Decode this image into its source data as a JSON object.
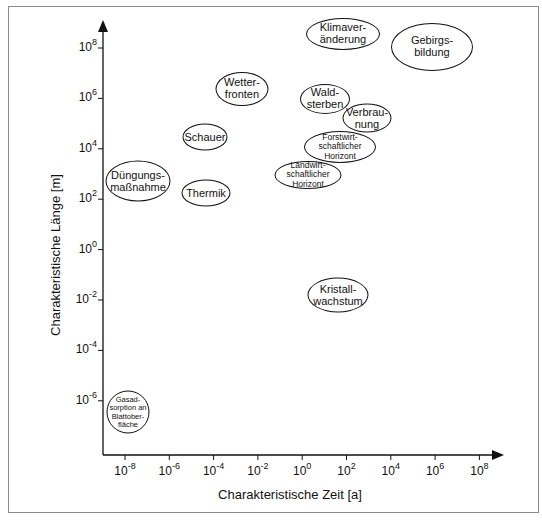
{
  "chart_data": {
    "type": "scatter",
    "title": "",
    "xlabel": "Charakteristische Zeit [a]",
    "ylabel": "Charakteristische Länge [m]",
    "xscale": "log",
    "yscale": "log",
    "x_tick_labels": [
      {
        "base": "10",
        "exp": "-8"
      },
      {
        "base": "10",
        "exp": "-6"
      },
      {
        "base": "10",
        "exp": "-4"
      },
      {
        "base": "10",
        "exp": "-2"
      },
      {
        "base": "10",
        "exp": "0"
      },
      {
        "base": "10",
        "exp": "2"
      },
      {
        "base": "10",
        "exp": "4"
      },
      {
        "base": "10",
        "exp": "6"
      },
      {
        "base": "10",
        "exp": "8"
      }
    ],
    "y_tick_labels": [
      {
        "base": "10",
        "exp": "8"
      },
      {
        "base": "10",
        "exp": "6"
      },
      {
        "base": "10",
        "exp": "4"
      },
      {
        "base": "10",
        "exp": "2"
      },
      {
        "base": "10",
        "exp": "0"
      },
      {
        "base": "10",
        "exp": "-2"
      },
      {
        "base": "10",
        "exp": "-4"
      },
      {
        "base": "10",
        "exp": "-6"
      }
    ],
    "xlim_log10": [
      -9,
      10
    ],
    "ylim_log10": [
      -8,
      9
    ],
    "grid": false,
    "legend": null,
    "points": [
      {
        "label": "Klimaver-\nänderung",
        "log10_time": 1.8,
        "log10_length": 8.6,
        "cx": 343,
        "cy": 34,
        "w": 74,
        "h": 32,
        "font": 11
      },
      {
        "label": "Gebirgs-\nbildung",
        "log10_time": 5.9,
        "log10_length": 8.1,
        "cx": 432,
        "cy": 47,
        "w": 82,
        "h": 48,
        "font": 11
      },
      {
        "label": "Wetter-\nfronten",
        "log10_time": -2.7,
        "log10_length": 6.4,
        "cx": 242,
        "cy": 89,
        "w": 53,
        "h": 34,
        "font": 11
      },
      {
        "label": "Wald-\nsterben",
        "log10_time": 1.0,
        "log10_length": 6.0,
        "cx": 325,
        "cy": 99,
        "w": 50,
        "h": 30,
        "font": 11
      },
      {
        "label": "Verbrau-\nnung",
        "log10_time": 2.9,
        "log10_length": 5.2,
        "cx": 367,
        "cy": 118,
        "w": 49,
        "h": 29,
        "font": 11
      },
      {
        "label": "Schauer",
        "log10_time": -4.4,
        "log10_length": 4.5,
        "cx": 205,
        "cy": 137,
        "w": 45,
        "h": 27,
        "font": 11
      },
      {
        "label": "Forstwirt-\nschaftlicher\nHorizont",
        "log10_time": 1.7,
        "log10_length": 4.1,
        "cx": 340,
        "cy": 147,
        "w": 72,
        "h": 32,
        "font": 8.5
      },
      {
        "label": "Landwirt-\nschaftlicher\nHorizont",
        "log10_time": 0.3,
        "log10_length": 3.0,
        "cx": 308,
        "cy": 175,
        "w": 67,
        "h": 28,
        "font": 8.5
      },
      {
        "label": "Düngungs-\nmaßnahme",
        "log10_time": -7.4,
        "log10_length": 2.7,
        "cx": 138,
        "cy": 181,
        "w": 65,
        "h": 41,
        "font": 11
      },
      {
        "label": "Thermik",
        "log10_time": -4.3,
        "log10_length": 2.3,
        "cx": 206,
        "cy": 193,
        "w": 49,
        "h": 27,
        "font": 11
      },
      {
        "label": "Kristall-\nwachstum",
        "log10_time": 1.6,
        "log10_length": -1.8,
        "cx": 338,
        "cy": 295,
        "w": 61,
        "h": 35,
        "font": 11
      },
      {
        "label": "Gasad-\nsorption an\nBlattober-\nfläche",
        "log10_time": -7.9,
        "log10_length": -6.4,
        "cx": 128,
        "cy": 412,
        "w": 43,
        "h": 43,
        "font": 7.5
      }
    ]
  },
  "colors": {
    "frame": "#8a8a8a",
    "ink": "#111111",
    "background": "#ffffff"
  }
}
